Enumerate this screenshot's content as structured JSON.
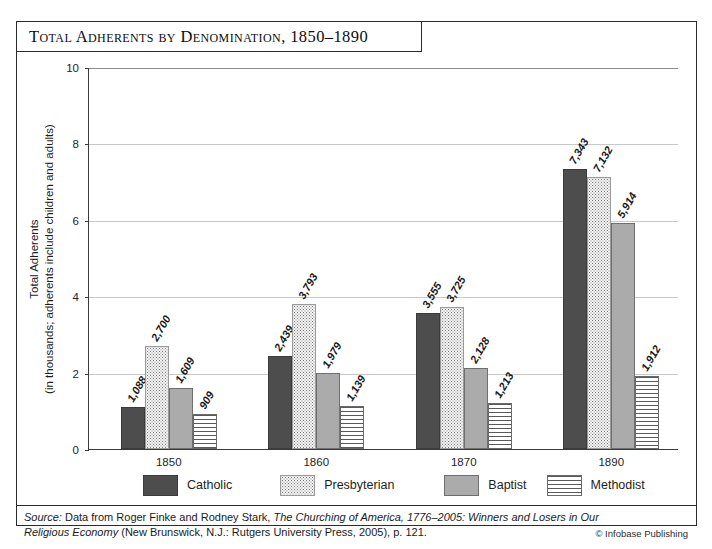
{
  "title": "Total Adherents by Denomination, 1850–1890",
  "chart_data": {
    "type": "bar",
    "title": "Total Adherents by Denomination, 1850–1890",
    "xlabel": "",
    "ylabel": "Total Adherents (in thousands; adherents include children and adults)",
    "ylabel_line1": "Total Adherents",
    "ylabel_line2": "(in thousands; adherents include children and adults)",
    "categories": [
      "1850",
      "1860",
      "1870",
      "1890"
    ],
    "ylim": [
      0,
      10
    ],
    "yticks": [
      0,
      2,
      4,
      6,
      8,
      10
    ],
    "ytick_labels": [
      "0",
      "2",
      "4",
      "6",
      "8",
      "10"
    ],
    "grid": true,
    "legend_position": "bottom",
    "series": [
      {
        "name": "Catholic",
        "pattern": "solid-dark",
        "color": "#4d4d4d",
        "values": [
          1088,
          2439,
          3555,
          7343
        ],
        "labels": [
          "1,088",
          "2,439",
          "3,555",
          "7,343"
        ]
      },
      {
        "name": "Presbyterian",
        "pattern": "stipple",
        "color": "#f4f4f4",
        "values": [
          2700,
          3793,
          3725,
          7132
        ],
        "labels": [
          "2,700",
          "3,793",
          "3,725",
          "7,132"
        ]
      },
      {
        "name": "Baptist",
        "pattern": "solid-mid",
        "color": "#ababab",
        "values": [
          1609,
          1979,
          2128,
          5914
        ],
        "labels": [
          "1,609",
          "1,979",
          "2,128",
          "5,914"
        ]
      },
      {
        "name": "Methodist",
        "pattern": "horizontal-lines",
        "color": "#ffffff",
        "values": [
          909,
          1139,
          1213,
          1912
        ],
        "labels": [
          "909",
          "1,139",
          "1,213",
          "1,912"
        ]
      }
    ]
  },
  "source": {
    "prefix": "Source:",
    "line1_a": " Data from Roger Finke and Rodney Stark, ",
    "line1_italic": "The Churching of America, 1776–2005: Winners and Losers",
    "line2_italic": "in Our Religious Economy",
    "line2_b": " (New Brunswick, N.J.: Rutgers University Press, 2005), p. 121."
  },
  "copyright": "© Infobase Publishing"
}
